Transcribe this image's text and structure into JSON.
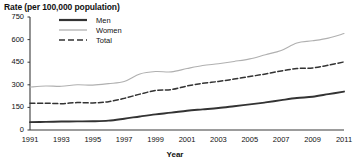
{
  "chart_data": {
    "type": "line",
    "title": "",
    "ylabel": "Rate (per 100,000 population)",
    "xlabel": "Year",
    "grid": false,
    "legend_position": "top-left",
    "xlim": [
      1991,
      2011
    ],
    "ylim": [
      0,
      750
    ],
    "yticks": [
      0,
      150,
      300,
      450,
      600,
      750
    ],
    "xticks": [
      1991,
      1993,
      1995,
      1997,
      1999,
      2001,
      2003,
      2005,
      2007,
      2009,
      2011
    ],
    "x": [
      1991,
      1992,
      1993,
      1994,
      1995,
      1996,
      1997,
      1998,
      1999,
      2000,
      2001,
      2002,
      2003,
      2004,
      2005,
      2006,
      2007,
      2008,
      2009,
      2010,
      2011
    ],
    "series": [
      {
        "name": "Men",
        "style": "solid-dark",
        "color": "#333333",
        "values": [
          52,
          54,
          56,
          57,
          58,
          62,
          75,
          90,
          104,
          115,
          128,
          137,
          146,
          158,
          170,
          183,
          198,
          212,
          221,
          238,
          255
        ]
      },
      {
        "name": "Women",
        "style": "solid-light",
        "color": "#b0b0b0",
        "values": [
          285,
          292,
          290,
          300,
          298,
          308,
          322,
          372,
          388,
          386,
          408,
          428,
          440,
          455,
          472,
          500,
          528,
          578,
          592,
          610,
          640
        ]
      },
      {
        "name": "Total",
        "style": "dashed",
        "color": "#333333",
        "values": [
          178,
          178,
          175,
          182,
          180,
          188,
          210,
          238,
          262,
          268,
          292,
          310,
          322,
          338,
          355,
          372,
          392,
          408,
          412,
          430,
          452
        ]
      }
    ]
  },
  "legend": {
    "items": [
      {
        "label": "Men"
      },
      {
        "label": "Women"
      },
      {
        "label": "Total"
      }
    ]
  },
  "colors": {
    "men": "#333333",
    "women": "#b0b0b0",
    "total": "#333333",
    "axis": "#3a3a3a",
    "text": "#111111",
    "background": "#ffffff"
  }
}
